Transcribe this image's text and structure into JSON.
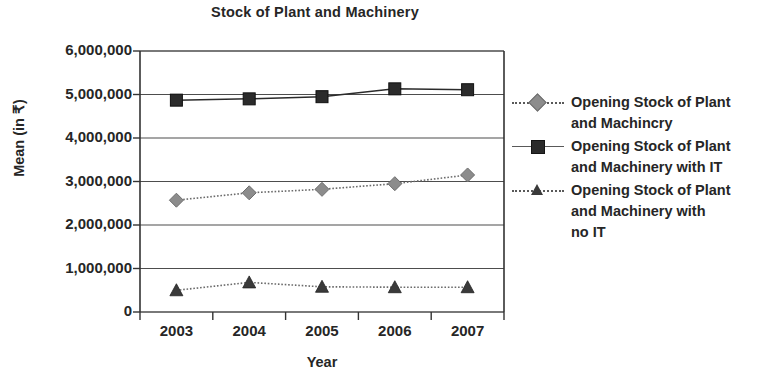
{
  "chart_data": {
    "type": "line",
    "title": "Stock of Plant and Machinery",
    "xlabel": "Year",
    "ylabel": "Mean (in ₹)",
    "categories": [
      "2003",
      "2004",
      "2005",
      "2006",
      "2007"
    ],
    "x": [
      2003,
      2004,
      2005,
      2006,
      2007
    ],
    "ylim": [
      0,
      6000000
    ],
    "y_ticks": [
      0,
      1000000,
      2000000,
      3000000,
      4000000,
      5000000,
      6000000
    ],
    "y_tick_labels": [
      "0",
      "1,000,000",
      "2,000,000",
      "3,000,000",
      "4,000,000",
      "5,000,000",
      "6,000,000"
    ],
    "grid": true,
    "legend_position": "right",
    "series": [
      {
        "name": "Opening Stock of Plant and Machincry",
        "marker": "diamond",
        "color": "#8c8c8c",
        "line_style": "dotted",
        "values": [
          2570000,
          2740000,
          2820000,
          2950000,
          3150000
        ]
      },
      {
        "name": "Opening Stock of Plant and Machinery with IT",
        "marker": "square",
        "color": "#2b2b2b",
        "line_style": "solid",
        "values": [
          4870000,
          4900000,
          4950000,
          5130000,
          5110000
        ]
      },
      {
        "name": "Opening Stock of Plant and Machinery with no IT",
        "marker": "triangle",
        "color": "#3a3a3a",
        "line_style": "dotted",
        "values": [
          500000,
          680000,
          580000,
          570000,
          570000
        ]
      }
    ]
  },
  "legend": {
    "entries": [
      {
        "lines": [
          "Opening Stock of Plant",
          "and Machincry"
        ]
      },
      {
        "lines": [
          "Opening Stock of Plant",
          "and Machinery with IT"
        ]
      },
      {
        "lines": [
          "Opening Stock of Plant",
          "and Machinery with",
          "no IT"
        ]
      }
    ]
  },
  "axis": {
    "y_title": "Mean (in ₹)",
    "x_title": "Year"
  }
}
